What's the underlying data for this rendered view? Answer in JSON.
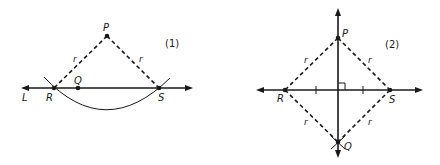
{
  "figures": [
    {
      "id": "1",
      "label": "(1)",
      "points": {
        "P": {
          "label": "P",
          "x": 107,
          "y": 36
        },
        "Q": {
          "label": "Q",
          "x": 78,
          "y": 88
        },
        "R": {
          "label": "R",
          "x": 54,
          "y": 88
        },
        "S": {
          "label": "S",
          "x": 159,
          "y": 88
        }
      },
      "line_label": "L",
      "radius_labels": [
        "r",
        "r"
      ]
    },
    {
      "id": "2",
      "label": "(2)",
      "points": {
        "P": {
          "label": "P",
          "x": 338,
          "y": 38
        },
        "Q": {
          "label": "Q",
          "x": 338,
          "y": 142
        },
        "R": {
          "label": "R",
          "x": 285,
          "y": 90
        },
        "S": {
          "label": "S",
          "x": 390,
          "y": 90
        }
      },
      "radius_labels": [
        "r",
        "r",
        "r",
        "r"
      ],
      "annotations": [
        "right-angle-marker",
        "equal-segment-ticks"
      ]
    }
  ]
}
